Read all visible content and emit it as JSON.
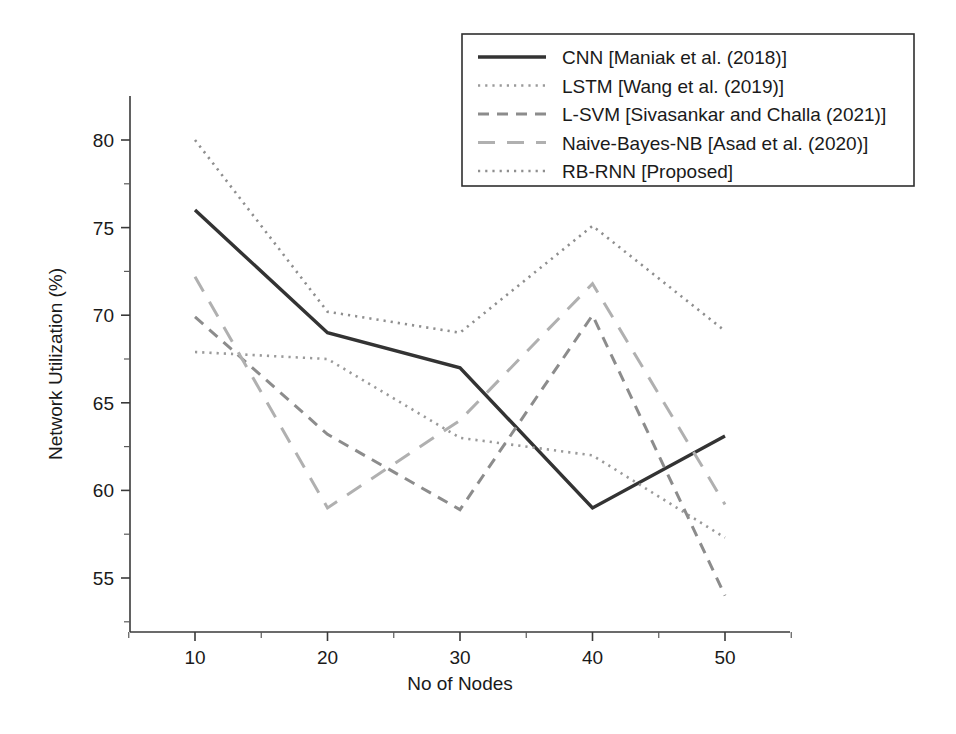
{
  "chart_data": {
    "type": "line",
    "title": "",
    "xlabel": "No of Nodes",
    "ylabel": "Network Utilization (%)",
    "x": [
      10,
      20,
      30,
      40,
      50
    ],
    "xticklabels": [
      "10",
      "20",
      "30",
      "40",
      "50"
    ],
    "yticklabels": [
      "55",
      "60",
      "65",
      "70",
      "75",
      "80"
    ],
    "yticks": [
      55,
      60,
      65,
      70,
      75,
      80
    ],
    "xlim": [
      5,
      55
    ],
    "ylim": [
      53,
      81.5
    ],
    "grid": false,
    "legend_position": "top-right",
    "series": [
      {
        "name": "CNN [Maniak et al. (2018)]",
        "style": "solid",
        "color": "#333333",
        "values": [
          76.0,
          69.0,
          67.0,
          59.0,
          63.1
        ]
      },
      {
        "name": "LSTM [Wang et al. (2019)]",
        "style": "dotted",
        "color": "#9a9a9a",
        "values": [
          67.9,
          67.5,
          63.0,
          62.0,
          57.3
        ]
      },
      {
        "name": "L-SVM [Sivasankar and Challa (2021)]",
        "style": "dashed",
        "color": "#8c8c8c",
        "values": [
          69.9,
          63.2,
          58.9,
          70.0,
          54.0
        ]
      },
      {
        "name": "Naive-Bayes-NB [Asad et al. (2020)]",
        "style": "long-dashed",
        "color": "#b0b0b0",
        "values": [
          72.2,
          59.0,
          64.0,
          71.8,
          59.2
        ]
      },
      {
        "name": "RB-RNN [Proposed]",
        "style": "dotted",
        "color": "#8f8f8f",
        "values": [
          80.0,
          70.2,
          69.0,
          75.1,
          69.1
        ]
      }
    ]
  },
  "legend": {
    "items": [
      {
        "label": "CNN [Maniak et al. (2018)]"
      },
      {
        "label": "LSTM [Wang et al. (2019)]"
      },
      {
        "label": "L-SVM [Sivasankar and Challa (2021)]"
      },
      {
        "label": "Naive-Bayes-NB [Asad et al. (2020)]"
      },
      {
        "label": "RB-RNN [Proposed]"
      }
    ]
  },
  "axes": {
    "x_title": "No of Nodes",
    "y_title": "Network Utilization (%)",
    "x_ticks": [
      "10",
      "20",
      "30",
      "40",
      "50"
    ],
    "y_ticks": [
      "55",
      "60",
      "65",
      "70",
      "75",
      "80"
    ]
  }
}
